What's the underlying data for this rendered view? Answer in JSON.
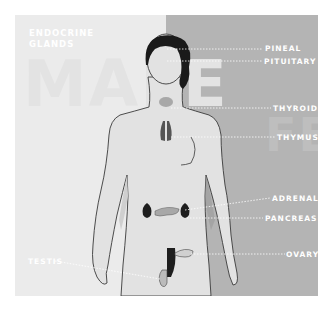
{
  "title": {
    "line1": "ENDOCRINE",
    "line2": "GLANDS"
  },
  "watermarks": {
    "left": "MALE",
    "right": "FEMALE"
  },
  "labels": {
    "pineal": "PINEAL",
    "pituitary": "PITUITARY",
    "thyroid": "THYROID",
    "thymus": "THYMUS",
    "adrenal": "ADRENAL",
    "pancreas": "PANCREAS",
    "ovary": "OVARY",
    "testis": "TESTIS"
  },
  "colors": {
    "left_bg": "#ebebeb",
    "right_bg": "#b4b4b4",
    "label_text": "#ffffff",
    "organ": "#2a2a2a",
    "hair": "#1a1a1a"
  }
}
